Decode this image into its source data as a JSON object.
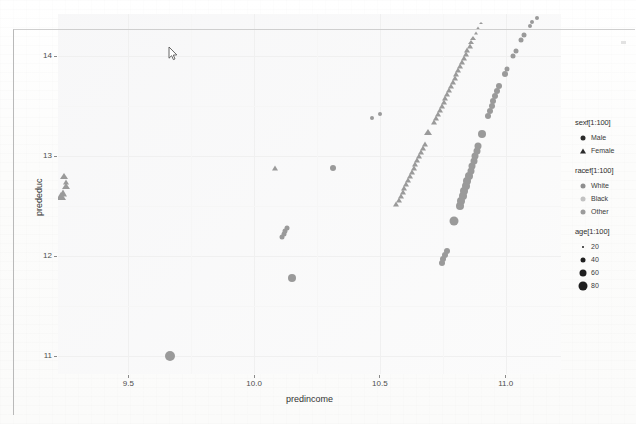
{
  "window": {
    "cursor_icon": "mouse-pointer-icon"
  },
  "chart_data": {
    "type": "scatter",
    "title": "",
    "xlabel": "predincome",
    "ylabel": "prededuc",
    "xlim": [
      9.22,
      11.22
    ],
    "ylim": [
      10.82,
      14.42
    ],
    "xticks": [
      "9.5",
      "10.0",
      "10.5",
      "11.0"
    ],
    "xtick_values": [
      9.5,
      10.0,
      10.5,
      11.0
    ],
    "yticks": [
      "14",
      "13",
      "12",
      "11"
    ],
    "ytick_values": [
      14,
      13,
      12,
      11
    ],
    "grid": true,
    "legend_position": "right",
    "legends": [
      {
        "name": "sex-legend",
        "title": "sexf[1:100]",
        "encoding": "shape",
        "entries": [
          {
            "label": "Male",
            "shape": "circle",
            "color": "#2b2b2b"
          },
          {
            "label": "Female",
            "shape": "triangle",
            "color": "#2b2b2b"
          }
        ]
      },
      {
        "name": "race-legend",
        "title": "racef[1:100]",
        "encoding": "color",
        "entries": [
          {
            "label": "White",
            "shape": "circle",
            "color": "#8e8e8e"
          },
          {
            "label": "Black",
            "shape": "circle",
            "color": "#c2c2c2"
          },
          {
            "label": "Other",
            "shape": "circle",
            "color": "#9b9b9b"
          }
        ]
      },
      {
        "name": "age-legend",
        "title": "age[1:100]",
        "encoding": "size",
        "entries": [
          {
            "label": "20",
            "shape": "circle",
            "color": "#1f1f1f",
            "size": 2
          },
          {
            "label": "40",
            "shape": "circle",
            "color": "#1f1f1f",
            "size": 5
          },
          {
            "label": "60",
            "shape": "circle",
            "color": "#1f1f1f",
            "size": 7
          },
          {
            "label": "80",
            "shape": "circle",
            "color": "#1f1f1f",
            "size": 9
          }
        ]
      }
    ],
    "series": [
      {
        "name": "Female",
        "shape": "triangle",
        "color": "#9a9a9a",
        "points": [
          [
            9.245,
            12.8,
            7
          ],
          [
            9.252,
            12.74,
            6
          ],
          [
            9.25,
            12.7,
            7
          ],
          [
            9.238,
            12.63,
            8
          ],
          [
            9.232,
            12.6,
            9
          ],
          [
            10.082,
            12.88,
            6
          ],
          [
            10.565,
            12.52,
            6
          ],
          [
            10.575,
            12.56,
            6
          ],
          [
            10.583,
            12.6,
            6
          ],
          [
            10.59,
            12.64,
            6
          ],
          [
            10.597,
            12.68,
            6
          ],
          [
            10.604,
            12.72,
            6
          ],
          [
            10.612,
            12.76,
            6
          ],
          [
            10.619,
            12.8,
            6
          ],
          [
            10.626,
            12.84,
            6
          ],
          [
            10.634,
            12.88,
            6
          ],
          [
            10.641,
            12.92,
            6
          ],
          [
            10.648,
            12.96,
            6
          ],
          [
            10.656,
            13.0,
            6
          ],
          [
            10.663,
            13.04,
            6
          ],
          [
            10.67,
            13.08,
            6
          ],
          [
            10.678,
            13.12,
            6
          ],
          [
            10.69,
            13.24,
            7
          ],
          [
            10.716,
            13.34,
            6
          ],
          [
            10.724,
            13.38,
            6
          ],
          [
            10.731,
            13.42,
            6
          ],
          [
            10.738,
            13.46,
            6
          ],
          [
            10.746,
            13.5,
            6
          ],
          [
            10.753,
            13.54,
            6
          ],
          [
            10.76,
            13.58,
            6
          ],
          [
            10.768,
            13.62,
            6
          ],
          [
            10.775,
            13.66,
            6
          ],
          [
            10.782,
            13.7,
            6
          ],
          [
            10.79,
            13.74,
            6
          ],
          [
            10.797,
            13.78,
            6
          ],
          [
            10.804,
            13.82,
            6
          ],
          [
            10.812,
            13.86,
            6
          ],
          [
            10.819,
            13.9,
            6
          ],
          [
            10.826,
            13.94,
            6
          ],
          [
            10.834,
            13.98,
            6
          ],
          [
            10.841,
            14.02,
            6
          ],
          [
            10.848,
            14.06,
            6
          ],
          [
            10.856,
            14.1,
            6
          ],
          [
            10.863,
            14.14,
            5
          ],
          [
            10.871,
            14.18,
            5
          ],
          [
            10.88,
            14.23,
            4
          ],
          [
            10.89,
            14.28,
            4
          ],
          [
            10.9,
            14.33,
            3
          ]
        ]
      },
      {
        "name": "Male",
        "shape": "circle",
        "color": "#9a9a9a",
        "points": [
          [
            9.665,
            11.0,
            10
          ],
          [
            10.112,
            12.19,
            5
          ],
          [
            10.118,
            12.22,
            5
          ],
          [
            10.124,
            12.25,
            5
          ],
          [
            10.13,
            12.28,
            5
          ],
          [
            10.15,
            11.78,
            8
          ],
          [
            10.315,
            12.88,
            6
          ],
          [
            10.745,
            11.93,
            6
          ],
          [
            10.752,
            11.97,
            6
          ],
          [
            10.759,
            12.01,
            6
          ],
          [
            10.766,
            12.05,
            6
          ],
          [
            10.796,
            12.35,
            9
          ],
          [
            10.818,
            12.5,
            8
          ],
          [
            10.824,
            12.55,
            8
          ],
          [
            10.83,
            12.6,
            8
          ],
          [
            10.836,
            12.65,
            8
          ],
          [
            10.842,
            12.7,
            8
          ],
          [
            10.848,
            12.75,
            8
          ],
          [
            10.854,
            12.8,
            8
          ],
          [
            10.86,
            12.85,
            7
          ],
          [
            10.866,
            12.9,
            7
          ],
          [
            10.872,
            12.95,
            7
          ],
          [
            10.878,
            13.0,
            7
          ],
          [
            10.884,
            13.05,
            7
          ],
          [
            10.89,
            13.1,
            7
          ],
          [
            10.905,
            13.22,
            8
          ],
          [
            10.93,
            13.4,
            6
          ],
          [
            10.937,
            13.45,
            6
          ],
          [
            10.944,
            13.5,
            6
          ],
          [
            10.951,
            13.55,
            6
          ],
          [
            10.958,
            13.6,
            6
          ],
          [
            10.965,
            13.65,
            6
          ],
          [
            10.972,
            13.7,
            6
          ],
          [
            10.996,
            13.82,
            6
          ],
          [
            11.004,
            13.87,
            5
          ],
          [
            11.03,
            14.0,
            5
          ],
          [
            11.04,
            14.05,
            5
          ],
          [
            11.062,
            14.16,
            5
          ],
          [
            11.072,
            14.21,
            5
          ],
          [
            11.095,
            14.3,
            4
          ],
          [
            11.105,
            14.34,
            4
          ],
          [
            11.125,
            14.38,
            4
          ],
          [
            10.47,
            13.38,
            4
          ],
          [
            10.5,
            13.42,
            4
          ]
        ]
      }
    ]
  }
}
